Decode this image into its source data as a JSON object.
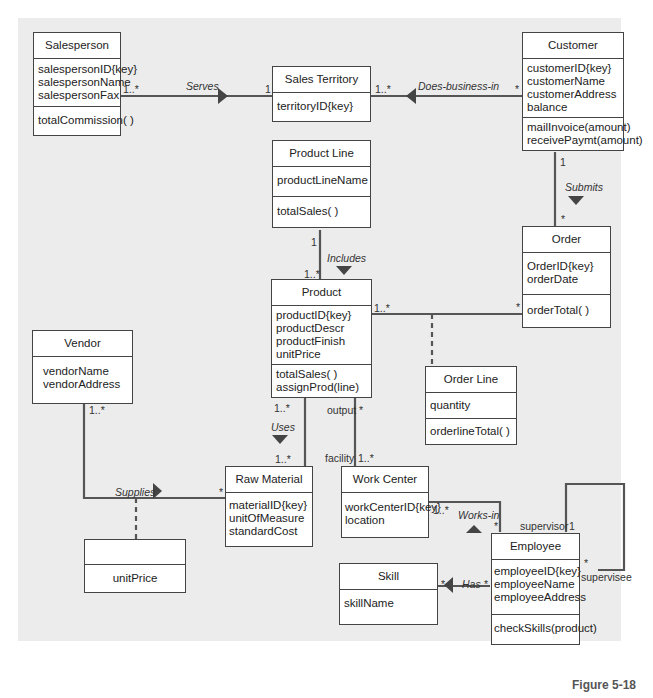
{
  "classes": {
    "salesperson": {
      "name": "Salesperson",
      "attributes": [
        "salespersonID{key}",
        "salespersonName",
        "salespersonFax"
      ],
      "operations": [
        "totalCommission( )"
      ]
    },
    "sales_territory": {
      "name": "Sales Territory",
      "attributes": [
        "territoryID{key}"
      ],
      "operations": []
    },
    "customer": {
      "name": "Customer",
      "attributes": [
        "customerID{key}",
        "customerName",
        "customerAddress",
        "balance"
      ],
      "operations": [
        "mailInvoice(amount)",
        "receivePaymt(amount)"
      ]
    },
    "product_line": {
      "name": "Product Line",
      "attributes": [
        "productLineName"
      ],
      "operations": [
        "totalSales( )"
      ]
    },
    "order": {
      "name": "Order",
      "attributes": [
        "OrderID{key}",
        "orderDate"
      ],
      "operations": [
        "orderTotal( )"
      ]
    },
    "product": {
      "name": "Product",
      "attributes": [
        "productID{key}",
        "productDescr",
        "productFinish",
        "unitPrice"
      ],
      "operations": [
        "totalSales( )",
        "assignProd(line)"
      ]
    },
    "vendor": {
      "name": "Vendor",
      "attributes": [
        "vendorName",
        "vendorAddress"
      ],
      "operations": []
    },
    "order_line": {
      "name": "Order Line",
      "attributes": [
        "quantity"
      ],
      "operations": [
        "orderlineTotal( )"
      ]
    },
    "raw_material": {
      "name": "Raw Material",
      "attributes": [
        "materialID{key}",
        "unitOfMeasure",
        "standardCost"
      ],
      "operations": []
    },
    "work_center": {
      "name": "Work Center",
      "attributes": [
        "workCenterID{key}",
        "location"
      ],
      "operations": []
    },
    "supplies_assoc": {
      "name": "",
      "attributes": [
        "unitPrice"
      ],
      "operations": []
    },
    "employee": {
      "name": "Employee",
      "attributes": [
        "employeeID{key}",
        "employeeName",
        "employeeAddress"
      ],
      "operations": [
        "checkSkills(product)"
      ]
    },
    "skill": {
      "name": "Skill",
      "attributes": [
        "skillName"
      ],
      "operations": []
    }
  },
  "associations": {
    "serves": {
      "name": "Serves",
      "m1": "1..*",
      "m2": "1"
    },
    "does_business_in": {
      "name": "Does-business-in",
      "m1": "1..*",
      "m2": "*"
    },
    "submits": {
      "name": "Submits",
      "m1": "1",
      "m2": "*"
    },
    "includes": {
      "name": "Includes",
      "m1": "1",
      "m2": "1..*"
    },
    "product_order": {
      "m1": "1..*",
      "m2": "*"
    },
    "uses": {
      "name": "Uses",
      "m1": "1..*",
      "m2": "1..*"
    },
    "output_facility": {
      "role1": "output",
      "m1": "*",
      "role2": "facility",
      "m2": "1..*"
    },
    "supplies": {
      "name": "Supplies",
      "m1": "1..*",
      "m2": "*"
    },
    "works_in": {
      "name": "Works-in",
      "m1": "1..*",
      "m2": "*"
    },
    "supervises": {
      "role1": "supervisor",
      "m1": "1",
      "role2": "supervisee",
      "m2": "*"
    },
    "has": {
      "name": "Has",
      "m1": "*",
      "m2": "*"
    }
  },
  "caption": "Figure 5-18"
}
